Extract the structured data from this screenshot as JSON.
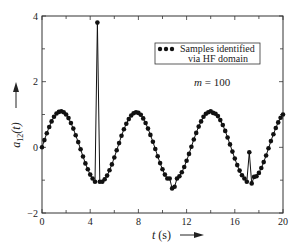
{
  "chart_data": {
    "type": "line",
    "title": "",
    "xlabel": "t (s)",
    "ylabel": "a12(t)",
    "xlim": [
      0,
      20
    ],
    "ylim": [
      -2,
      4
    ],
    "xticks": [
      0,
      4,
      8,
      12,
      16,
      20
    ],
    "yticks": [
      -2,
      0,
      2,
      4
    ],
    "grid": false,
    "legend": {
      "position": "upper right",
      "entries": [
        "Samples identified via HF domain"
      ]
    },
    "annotations": [
      "m = 100"
    ],
    "series": [
      {
        "name": "Samples identified via HF domain",
        "marker": "circle",
        "x": [
          0,
          0.2,
          0.4,
          0.6,
          0.8,
          1.0,
          1.2,
          1.4,
          1.6,
          1.8,
          2.0,
          2.2,
          2.4,
          2.6,
          2.8,
          3.0,
          3.2,
          3.4,
          3.6,
          3.8,
          4.0,
          4.2,
          4.4,
          4.6,
          4.8,
          5.0,
          5.2,
          5.4,
          5.6,
          5.8,
          6.0,
          6.2,
          6.4,
          6.6,
          6.8,
          7.0,
          7.2,
          7.4,
          7.6,
          7.8,
          8.0,
          8.2,
          8.4,
          8.6,
          8.8,
          9.0,
          9.2,
          9.4,
          9.6,
          9.8,
          10.0,
          10.2,
          10.4,
          10.6,
          10.8,
          11.0,
          11.2,
          11.4,
          11.6,
          11.8,
          12.0,
          12.2,
          12.4,
          12.6,
          12.8,
          13.0,
          13.2,
          13.4,
          13.6,
          13.8,
          14.0,
          14.2,
          14.4,
          14.6,
          14.8,
          15.0,
          15.2,
          15.4,
          15.6,
          15.8,
          16.0,
          16.2,
          16.4,
          16.6,
          16.8,
          17.0,
          17.2,
          17.4,
          17.6,
          17.8,
          18.0,
          18.2,
          18.4,
          18.6,
          18.8,
          19.0,
          19.2,
          19.4,
          19.6,
          19.8,
          20.0
        ],
        "y": [
          0.0,
          0.22,
          0.43,
          0.62,
          0.79,
          0.93,
          1.03,
          1.08,
          1.1,
          1.07,
          1.0,
          0.89,
          0.74,
          0.57,
          0.37,
          0.16,
          -0.06,
          -0.28,
          -0.49,
          -0.67,
          -0.83,
          -0.95,
          -1.05,
          3.8,
          -1.05,
          -1.05,
          -0.97,
          -0.86,
          -0.7,
          -0.52,
          -0.31,
          -0.09,
          0.13,
          0.35,
          0.55,
          0.72,
          0.86,
          0.97,
          1.04,
          1.07,
          1.05,
          0.99,
          0.88,
          0.74,
          0.57,
          0.38,
          0.17,
          -0.05,
          -0.27,
          -0.48,
          -0.67,
          -0.83,
          -0.95,
          -0.95,
          -1.25,
          -1.2,
          -0.95,
          -0.88,
          -0.76,
          -0.6,
          -0.41,
          -0.2,
          0.02,
          0.24,
          0.44,
          0.63,
          0.79,
          0.93,
          1.02,
          1.07,
          1.1,
          1.05,
          1.02,
          0.95,
          0.83,
          0.68,
          0.5,
          0.3,
          0.09,
          -0.13,
          -0.34,
          -0.54,
          -0.71,
          -0.85,
          -0.95,
          -1.05,
          -0.15,
          -1.1,
          -0.9,
          -0.88,
          -0.78,
          -0.63,
          -0.45,
          -0.25,
          -0.03,
          0.19,
          0.4,
          0.59,
          0.76,
          0.9,
          1.0
        ]
      }
    ]
  },
  "legend": {
    "line1": "Samples identified",
    "line2": "via HF domain"
  },
  "annotation": {
    "m_label": "m = 100"
  },
  "axes": {
    "xlabel": "t (s)",
    "ylabel_main": "a",
    "ylabel_sub": "12",
    "ylabel_arg": "(t)",
    "xtick_labels": [
      "0",
      "4",
      "8",
      "12",
      "16",
      "20"
    ],
    "ytick_labels": [
      "-2",
      "0",
      "2",
      "4"
    ]
  }
}
